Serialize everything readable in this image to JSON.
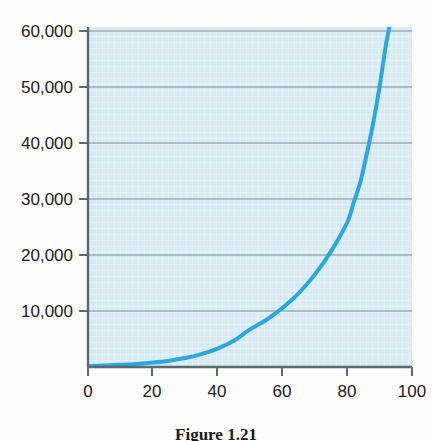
{
  "figure": {
    "caption": "Figure 1.21",
    "background_color": "#fdfdfb"
  },
  "chart_data": {
    "type": "line",
    "title": "",
    "xlabel": "",
    "ylabel": "",
    "xlim": [
      0,
      100
    ],
    "ylim": [
      0,
      60000
    ],
    "grid": true,
    "legend": null,
    "plot_background_color": "#d6e9f0",
    "gridline_color": "#7a8c96",
    "axis_color": "#5a6a72",
    "series": [
      {
        "name": "exponential-growth-curve",
        "color": "#29a8e0",
        "line_width": 4,
        "x": [
          0,
          5,
          10,
          15,
          20,
          25,
          30,
          35,
          40,
          45,
          50,
          55,
          60,
          65,
          70,
          75,
          80,
          82,
          84,
          86,
          88,
          90,
          92,
          93
        ],
        "values": [
          180,
          260,
          380,
          540,
          780,
          1110,
          1590,
          2270,
          3250,
          4640,
          6630,
          8300,
          10400,
          13000,
          16300,
          20400,
          25500,
          29000,
          32500,
          37500,
          43000,
          49500,
          57000,
          60000
        ]
      }
    ],
    "x_ticks": [
      0,
      20,
      40,
      60,
      80,
      100
    ],
    "x_tick_labels": [
      "0",
      "20",
      "40",
      "60",
      "80",
      "100"
    ],
    "y_ticks": [
      10000,
      20000,
      30000,
      40000,
      50000,
      60000
    ],
    "y_tick_labels": [
      "10,000",
      "20,000",
      "30,000",
      "40,000",
      "50,000",
      "60,000"
    ]
  }
}
